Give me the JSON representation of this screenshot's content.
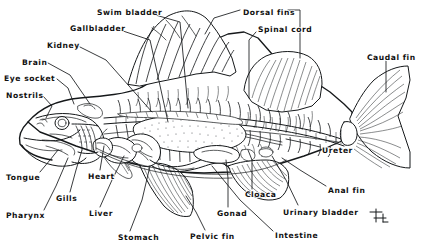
{
  "diagram": {
    "background_color": "#ffffff",
    "ink_color": "#15181a",
    "signature": "monogram-mark",
    "labels": [
      {
        "id": "swim-bladder",
        "text": "Swim bladder",
        "x": 97,
        "y": 12,
        "anchor": "start",
        "leader": [
          [
            152,
            14
          ],
          [
            180,
            22
          ],
          [
            188,
            108
          ]
        ]
      },
      {
        "id": "gallbladder",
        "text": "Gallbladder",
        "x": 70,
        "y": 28,
        "anchor": "start",
        "leader": [
          [
            120,
            30
          ],
          [
            150,
            40
          ],
          [
            168,
            122
          ]
        ]
      },
      {
        "id": "kidney",
        "text": "Kidney",
        "x": 47,
        "y": 45,
        "anchor": "start",
        "leader": [
          [
            80,
            47
          ],
          [
            106,
            60
          ],
          [
            152,
            112
          ]
        ]
      },
      {
        "id": "brain",
        "text": "Brain",
        "x": 22,
        "y": 62,
        "anchor": "start",
        "leader": [
          [
            48,
            63
          ],
          [
            70,
            75
          ],
          [
            90,
            104
          ]
        ]
      },
      {
        "id": "eye-socket",
        "text": "Eye socket",
        "x": 4,
        "y": 78,
        "anchor": "start",
        "leader": [
          [
            57,
            79
          ],
          [
            68,
            88
          ],
          [
            74,
            104
          ]
        ]
      },
      {
        "id": "nostrils",
        "text": "Nostrils",
        "x": 6,
        "y": 95,
        "anchor": "start",
        "leader": [
          [
            43,
            96
          ],
          [
            52,
            106
          ],
          [
            46,
            118
          ]
        ]
      },
      {
        "id": "dorsal-fins",
        "text": "Dorsal fins",
        "x": 243,
        "y": 12,
        "anchor": "start",
        "leader": [
          [
            240,
            10
          ],
          [
            214,
            18
          ],
          [
            205,
            34
          ]
        ]
      },
      {
        "id": "dorsal-fins-2",
        "text": "",
        "x": 0,
        "y": 0,
        "anchor": "start",
        "leader": [
          [
            288,
            10
          ],
          [
            300,
            10
          ],
          [
            300,
            58
          ]
        ]
      },
      {
        "id": "spinal-cord",
        "text": "Spinal cord",
        "x": 258,
        "y": 29,
        "anchor": "start",
        "leader": [
          [
            256,
            32
          ],
          [
            249,
            40
          ],
          [
            249,
            98
          ]
        ]
      },
      {
        "id": "caudal-fin",
        "text": "Caudal fin",
        "x": 367,
        "y": 57,
        "anchor": "start",
        "leader": [
          [
            386,
            61
          ],
          [
            386,
            92
          ]
        ]
      },
      {
        "id": "ureter",
        "text": "Ureter",
        "x": 322,
        "y": 150,
        "anchor": "start",
        "leader": [
          [
            320,
            147
          ],
          [
            300,
            142
          ],
          [
            286,
            139
          ]
        ]
      },
      {
        "id": "anal-fin",
        "text": "Anal fin",
        "x": 328,
        "y": 190,
        "anchor": "start",
        "leader": [
          [
            326,
            186
          ],
          [
            300,
            170
          ],
          [
            282,
            158
          ]
        ]
      },
      {
        "id": "urinary-bladder",
        "text": "Urinary bladder",
        "x": 283,
        "y": 212,
        "anchor": "start",
        "leader": [
          [
            298,
            205
          ],
          [
            286,
            180
          ],
          [
            272,
            156
          ]
        ]
      },
      {
        "id": "intestine",
        "text": "Intestine",
        "x": 275,
        "y": 235,
        "anchor": "start",
        "leader": [
          [
            273,
            231
          ],
          [
            240,
            200
          ],
          [
            212,
            166
          ]
        ]
      },
      {
        "id": "cloaca",
        "text": "Cloaca",
        "x": 245,
        "y": 194,
        "anchor": "start",
        "leader": [
          [
            252,
            189
          ],
          [
            252,
            160
          ],
          [
            248,
            150
          ]
        ]
      },
      {
        "id": "gonad",
        "text": "Gonad",
        "x": 217,
        "y": 213,
        "anchor": "start",
        "leader": [
          [
            228,
            207
          ],
          [
            228,
            178
          ],
          [
            226,
            160
          ]
        ]
      },
      {
        "id": "pelvic-fin",
        "text": "Pelvic fin",
        "x": 190,
        "y": 236,
        "anchor": "start",
        "leader": [
          [
            205,
            230
          ],
          [
            196,
            212
          ],
          [
            186,
            196
          ]
        ]
      },
      {
        "id": "stomach",
        "text": "Stomach",
        "x": 118,
        "y": 237,
        "anchor": "start",
        "leader": [
          [
            130,
            231
          ],
          [
            142,
            200
          ],
          [
            150,
            166
          ]
        ]
      },
      {
        "id": "liver",
        "text": "Liver",
        "x": 89,
        "y": 213,
        "anchor": "start",
        "leader": [
          [
            100,
            207
          ],
          [
            112,
            180
          ],
          [
            124,
            156
          ]
        ]
      },
      {
        "id": "heart",
        "text": "Heart",
        "x": 88,
        "y": 176,
        "anchor": "start",
        "leader": [
          [
            100,
            170
          ],
          [
            102,
            158
          ],
          [
            104,
            146
          ]
        ]
      },
      {
        "id": "gills",
        "text": "Gills",
        "x": 56,
        "y": 198,
        "anchor": "start",
        "leader": [
          [
            70,
            192
          ],
          [
            76,
            170
          ],
          [
            82,
            150
          ]
        ]
      },
      {
        "id": "pharynx",
        "text": "Pharynx",
        "x": 6,
        "y": 215,
        "anchor": "start",
        "leader": [
          [
            44,
            210
          ],
          [
            56,
            186
          ],
          [
            68,
            158
          ]
        ]
      },
      {
        "id": "tongue",
        "text": "Tongue",
        "x": 6,
        "y": 177,
        "anchor": "start",
        "leader": [
          [
            40,
            172
          ],
          [
            50,
            160
          ],
          [
            58,
            150
          ]
        ]
      }
    ]
  }
}
